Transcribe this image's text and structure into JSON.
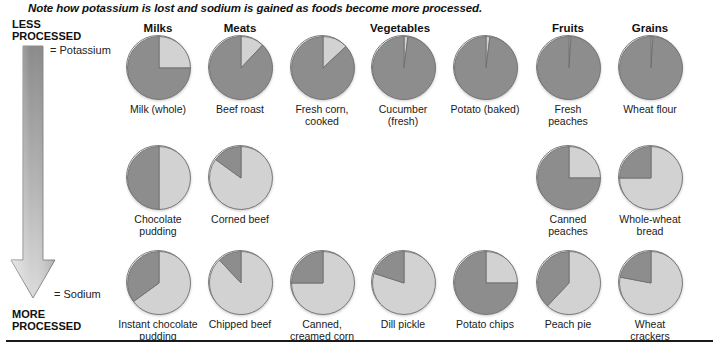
{
  "caption": "Note how potassium is lost and sodium is gained as foods become more processed.",
  "axis": {
    "top_label": "LESS\nPROCESSED",
    "bottom_label": "MORE\nPROCESSED",
    "legend_potassium": "= Potassium",
    "legend_sodium": "= Sodium"
  },
  "colors": {
    "potassium": "#8d8d8d",
    "sodium": "#d2d2d2",
    "outline": "#7a7a7a",
    "text": "#1a1a1a",
    "rule": "#1a1a1a"
  },
  "columns": [
    {
      "label": "Milks",
      "x": 158
    },
    {
      "label": "Meats",
      "x": 240
    },
    {
      "label": "Vegetables",
      "x": 400
    },
    {
      "label": "Fruits",
      "x": 568
    },
    {
      "label": "Grains",
      "x": 650
    }
  ],
  "chart_data": {
    "type": "pie",
    "title": "Note how potassium is lost and sodium is gained as foods become more processed.",
    "legend": [
      "Potassium",
      "Sodium"
    ],
    "legend_position": "left-axis",
    "value_units": "percent of combined potassium + sodium content",
    "groups": [
      "Milks",
      "Meats",
      "Vegetables",
      "Fruits",
      "Grains"
    ],
    "rows": [
      "less processed",
      "moderately processed",
      "more processed"
    ],
    "pies": [
      {
        "label": "Milk (whole)",
        "group": "Milks",
        "row": 0,
        "x": 158,
        "y": 68,
        "potassium": 75,
        "sodium": 25
      },
      {
        "label": "Beef roast",
        "group": "Meats",
        "row": 0,
        "x": 240,
        "y": 68,
        "potassium": 88,
        "sodium": 12
      },
      {
        "label": "Fresh corn,\ncooked",
        "group": "Meats",
        "row": 0,
        "x": 322,
        "y": 68,
        "potassium": 87,
        "sodium": 13
      },
      {
        "label": "Cucumber\n(fresh)",
        "group": "Vegetables",
        "row": 0,
        "x": 403,
        "y": 68,
        "potassium": 98,
        "sodium": 2
      },
      {
        "label": "Potato (baked)",
        "group": "Vegetables",
        "row": 0,
        "x": 485,
        "y": 68,
        "potassium": 98,
        "sodium": 2
      },
      {
        "label": "Fresh\npeaches",
        "group": "Fruits",
        "row": 0,
        "x": 568,
        "y": 68,
        "potassium": 99,
        "sodium": 1
      },
      {
        "label": "Wheat flour",
        "group": "Grains",
        "row": 0,
        "x": 650,
        "y": 68,
        "potassium": 99,
        "sodium": 1
      },
      {
        "label": "Chocolate\npudding",
        "group": "Milks",
        "row": 1,
        "x": 158,
        "y": 178,
        "potassium": 50,
        "sodium": 50
      },
      {
        "label": "Corned beef",
        "group": "Meats",
        "row": 1,
        "x": 240,
        "y": 178,
        "potassium": 15,
        "sodium": 85
      },
      {
        "label": "Canned\npeaches",
        "group": "Fruits",
        "row": 1,
        "x": 568,
        "y": 178,
        "potassium": 75,
        "sodium": 25
      },
      {
        "label": "Whole-wheat\nbread",
        "group": "Grains",
        "row": 1,
        "x": 650,
        "y": 178,
        "potassium": 25,
        "sodium": 75
      },
      {
        "label": "Instant chocolate\npudding",
        "group": "Milks",
        "row": 2,
        "x": 158,
        "y": 283,
        "potassium": 35,
        "sodium": 65
      },
      {
        "label": "Chipped beef",
        "group": "Meats",
        "row": 2,
        "x": 240,
        "y": 283,
        "potassium": 12,
        "sodium": 88
      },
      {
        "label": "Canned,\ncreamed corn",
        "group": "Meats",
        "row": 2,
        "x": 322,
        "y": 283,
        "potassium": 25,
        "sodium": 75
      },
      {
        "label": "Dill pickle",
        "group": "Vegetables",
        "row": 2,
        "x": 403,
        "y": 283,
        "potassium": 20,
        "sodium": 80
      },
      {
        "label": "Potato chips",
        "group": "Vegetables",
        "row": 2,
        "x": 485,
        "y": 283,
        "potassium": 75,
        "sodium": 25
      },
      {
        "label": "Peach pie",
        "group": "Fruits",
        "row": 2,
        "x": 568,
        "y": 283,
        "potassium": 38,
        "sodium": 62
      },
      {
        "label": "Wheat\ncrackers",
        "group": "Grains",
        "row": 2,
        "x": 650,
        "y": 283,
        "potassium": 22,
        "sodium": 78
      }
    ]
  }
}
